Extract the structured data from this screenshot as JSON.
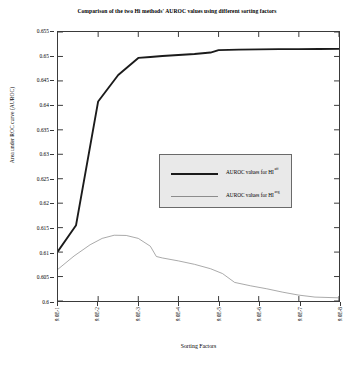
{
  "chart_data": {
    "type": "line",
    "title": "Comparison of the two Hi methods' AUROC values using different sorting factors",
    "xlabel": "Sorting Factors",
    "ylabel": "Area under ROC curve (AUROC)",
    "categories": [
      "9.0E-1",
      "9.0E-2",
      "9.0E-3",
      "9.0E-4",
      "9.0E-5",
      "9.0E-6",
      "9.0E-7",
      "9.0E-8"
    ],
    "ylim": [
      0.6,
      0.655
    ],
    "xlim": [
      0,
      7
    ],
    "yticks": [
      "0.6",
      "0.605",
      "0.61",
      "0.615",
      "0.62",
      "0.625",
      "0.63",
      "0.635",
      "0.64",
      "0.645",
      "0.65",
      "0.655"
    ],
    "ytick_values": [
      0.6,
      0.605,
      0.61,
      0.615,
      0.62,
      0.625,
      0.63,
      0.635,
      0.64,
      0.645,
      0.65,
      0.655
    ],
    "grid": false,
    "legend_position": "center",
    "series": [
      {
        "name": "AUROC values for HI",
        "superscript": "aff",
        "style": "thick",
        "color": "#1b1b1b",
        "x": [
          0,
          0.45,
          1.0,
          1.5,
          2.0,
          2.3,
          2.6,
          3.0,
          3.4,
          3.8,
          4.0,
          4.5,
          5.0,
          5.5,
          6.0,
          6.5,
          7.0
        ],
        "values": [
          0.6102,
          0.6155,
          0.6408,
          0.6462,
          0.6497,
          0.6499,
          0.6501,
          0.6503,
          0.6505,
          0.6508,
          0.6513,
          0.6514,
          0.65145,
          0.6515,
          0.6515,
          0.65152,
          0.65155
        ]
      },
      {
        "name": "AUROC values for HI",
        "superscript": "avg",
        "style": "thin",
        "color": "#8c8c8c",
        "x": [
          0,
          0.4,
          0.8,
          1.1,
          1.4,
          1.7,
          2.0,
          2.3,
          2.45,
          2.6,
          3.0,
          3.4,
          3.8,
          4.1,
          4.4,
          4.8,
          5.2,
          5.6,
          6.0,
          6.4,
          7.0
        ],
        "values": [
          0.6065,
          0.6092,
          0.6115,
          0.6128,
          0.61345,
          0.6134,
          0.6128,
          0.6112,
          0.6091,
          0.6088,
          0.6082,
          0.6075,
          0.6066,
          0.6056,
          0.6038,
          0.6031,
          0.6025,
          0.6018,
          0.6012,
          0.6008,
          0.60065
        ]
      }
    ]
  },
  "legend": {
    "entries": [
      {
        "label": "AUROC values for HI",
        "superscript": "aff"
      },
      {
        "label": "AUROC values for HI",
        "superscript": "avg"
      }
    ]
  }
}
